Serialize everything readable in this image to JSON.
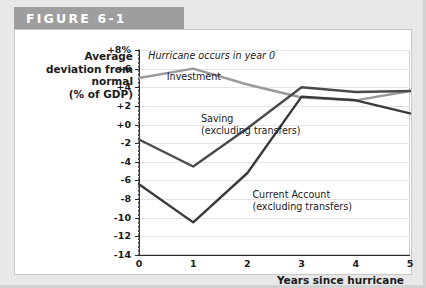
{
  "figure": {
    "header_label": "FIGURE 6-1"
  },
  "chart_data": {
    "type": "line",
    "title": "FIGURE 6-1",
    "xlabel": "Years since hurricane",
    "ylabel": "Average deviation from normal (% of GDP)",
    "ylabel_lines": [
      "Average",
      "deviation from",
      "normal",
      "(% of GDP)"
    ],
    "x": [
      0,
      1,
      2,
      3,
      4,
      5
    ],
    "xticklabels": [
      "0",
      "1",
      "2",
      "3",
      "4",
      "5"
    ],
    "xlim": [
      0,
      5
    ],
    "ylim": [
      -14,
      8
    ],
    "yticks": [
      8,
      6,
      4,
      2,
      0,
      -2,
      -4,
      -6,
      -8,
      -10,
      -12,
      -14
    ],
    "yticklabels": [
      "+8%",
      "+6",
      "+4",
      "+2",
      "+0",
      "-2",
      "-4",
      "-6",
      "-8",
      "-10",
      "-12",
      "-14"
    ],
    "grid": true,
    "legend": "inline-labels",
    "series": [
      {
        "name": "Investment",
        "color": "#9a9a9a",
        "values": [
          5.0,
          6.0,
          4.3,
          2.9,
          2.6,
          3.6
        ]
      },
      {
        "name": "Saving (excluding transfers)",
        "color": "#4a4a4a",
        "values": [
          -1.6,
          -4.5,
          -0.4,
          4.0,
          3.5,
          3.6
        ]
      },
      {
        "name": "Current Account (excluding transfers)",
        "color": "#3a3a3a",
        "values": [
          -6.4,
          -10.5,
          -5.2,
          3.0,
          2.6,
          1.2
        ]
      }
    ],
    "annotations": [
      {
        "text": "Hurricane occurs in year 0",
        "x": 0.08,
        "y": 7.4,
        "style": "italic"
      },
      {
        "text": "Investment",
        "x": 0.42,
        "y": 5.1,
        "style": "plain"
      },
      {
        "text": "Saving",
        "x": 1.05,
        "y": 0.6,
        "style": "plain"
      },
      {
        "text": "(excluding transfers)",
        "x": 1.05,
        "y": -0.7,
        "style": "plain"
      },
      {
        "text": "Current Account",
        "x": 2.0,
        "y": -7.6,
        "style": "plain"
      },
      {
        "text": "(excluding transfers)",
        "x": 2.0,
        "y": -8.9,
        "style": "plain"
      }
    ],
    "vertical_marker": {
      "name": "hurricane-year-marker",
      "x": 0,
      "style": "dotted",
      "color": "#3a3a3a"
    }
  }
}
